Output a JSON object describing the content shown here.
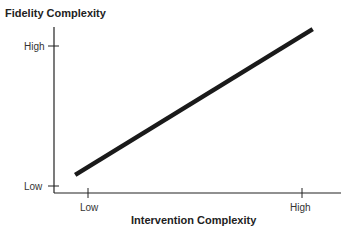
{
  "chart_data": {
    "type": "line",
    "title": "",
    "xlabel": "Intervention Complexity",
    "ylabel": "Fidelity Complexity",
    "x_ticks": [
      "Low",
      "High"
    ],
    "y_ticks": [
      "Low",
      "High"
    ],
    "xlim": [
      0,
      1
    ],
    "ylim": [
      0,
      1
    ],
    "grid": false,
    "legend": null,
    "series": [
      {
        "name": "Fidelity vs Intervention Complexity",
        "x": [
          -0.06,
          1.05
        ],
        "y": [
          0.08,
          1.12
        ],
        "color": "#1a1a1a"
      }
    ]
  }
}
